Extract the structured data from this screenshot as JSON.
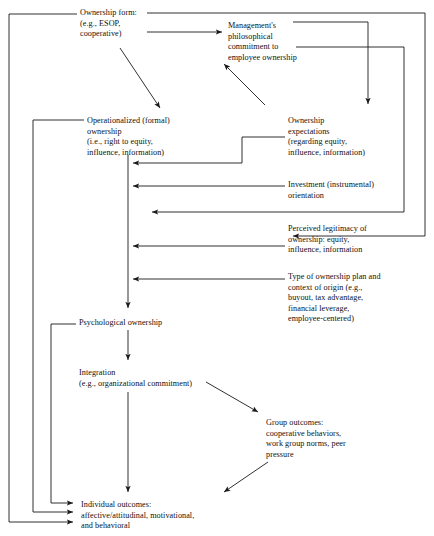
{
  "diagram": {
    "type": "flow-diagram",
    "background_color": "#ffffff",
    "line_color": "#1a1a1a",
    "text_color": "#111111",
    "nodes": [
      {
        "id": "ownership-form",
        "label": "Ownership form:\n(e.g., ESOP,\ncooperative)",
        "x": 80,
        "y": 8
      },
      {
        "id": "management-commitment",
        "label": "Management's\nphilosophical\ncommitment to\nemployee ownership",
        "x": 228,
        "y": 21
      },
      {
        "id": "operationalized-ownership",
        "label": "Operationalized (formal)\nownership\n(i.e., right to equity,\ninfluence, information)",
        "x": 87,
        "y": 116
      },
      {
        "id": "ownership-expectations",
        "label": "Ownership\nexpectations\n(regarding equity,\ninfluence, information)",
        "x": 288,
        "y": 116
      },
      {
        "id": "investment-orientation",
        "label": "Investment (instrumental)\norientation",
        "x": 288,
        "y": 180
      },
      {
        "id": "perceived-legitimacy",
        "label": "Perceived legitimacy of\nownership: equity,\ninfluence, information",
        "x": 288,
        "y": 224
      },
      {
        "id": "type-of-ownership-plan",
        "label": "Type of ownership plan and\ncontext of origin (e.g.,\nbuyout, tax advantage,\nfinancial leverage,\nemployee-centered)",
        "x": 288,
        "y": 272
      },
      {
        "id": "psychological-ownership",
        "label": "Psychological ownership",
        "x": 79,
        "y": 318
      },
      {
        "id": "integration",
        "label": "Integration\n(e.g., organizational commitment)",
        "x": 79,
        "y": 368
      },
      {
        "id": "group-outcomes",
        "label": "Group outcomes:\ncooperative behaviors,\nwork group norms, peer\npressure",
        "x": 266,
        "y": 418
      },
      {
        "id": "individual-outcomes",
        "label": "Individual outcomes:\naffective/attitudinal, motivational,\nand behavioral",
        "x": 81,
        "y": 500
      }
    ],
    "edges": [
      {
        "id": "ownership-form-to-management",
        "from": "ownership-form",
        "to": "management-commitment"
      },
      {
        "id": "ownership-form-to-operationalized",
        "from": "ownership-form",
        "to": "operationalized-ownership"
      },
      {
        "id": "ownership-form-to-legitimacy",
        "from": "ownership-form",
        "to": "perceived-legitimacy"
      },
      {
        "id": "management-to-expectations",
        "from": "management-commitment",
        "to": "ownership-expectations"
      },
      {
        "id": "management-to-operationalized",
        "from": "management-commitment",
        "to": "operationalized-ownership"
      },
      {
        "id": "expectations-to-main-path",
        "from": "ownership-expectations",
        "to": "psychological-ownership"
      },
      {
        "id": "investment-to-main-path",
        "from": "investment-orientation",
        "to": "psychological-ownership"
      },
      {
        "id": "legitimacy-to-main-path",
        "from": "perceived-legitimacy",
        "to": "psychological-ownership"
      },
      {
        "id": "plan-type-to-main-path",
        "from": "type-of-ownership-plan",
        "to": "psychological-ownership"
      },
      {
        "id": "operationalized-to-psychological",
        "from": "operationalized-ownership",
        "to": "psychological-ownership"
      },
      {
        "id": "psychological-to-integration",
        "from": "psychological-ownership",
        "to": "integration"
      },
      {
        "id": "integration-to-group",
        "from": "integration",
        "to": "group-outcomes"
      },
      {
        "id": "integration-to-individual",
        "from": "integration",
        "to": "individual-outcomes"
      },
      {
        "id": "group-to-individual",
        "from": "group-outcomes",
        "to": "individual-outcomes"
      },
      {
        "id": "operationalized-to-individual",
        "from": "operationalized-ownership",
        "to": "individual-outcomes"
      },
      {
        "id": "psychological-to-individual",
        "from": "psychological-ownership",
        "to": "individual-outcomes"
      },
      {
        "id": "ownership-form-to-individual",
        "from": "ownership-form",
        "to": "individual-outcomes"
      }
    ]
  }
}
